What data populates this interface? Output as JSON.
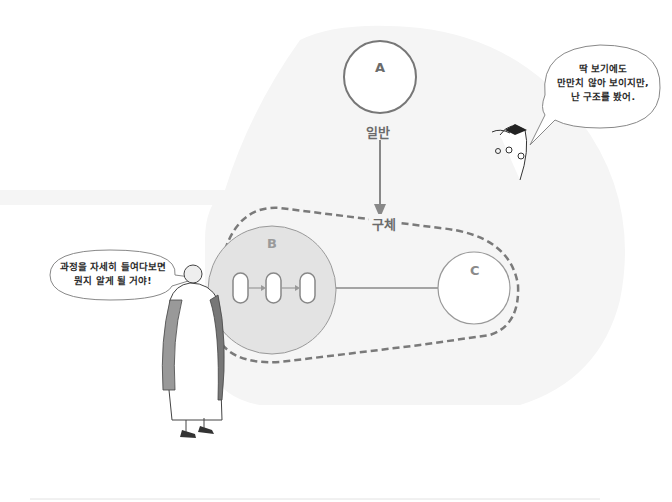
{
  "diagram": {
    "nodes": {
      "a": {
        "label": "A",
        "caption": "일반"
      },
      "b": {
        "label": "B",
        "process_steps": 3
      },
      "c": {
        "label": "C"
      }
    },
    "group_label": "구체",
    "edges": [
      {
        "from": "A",
        "to": "구체",
        "type": "arrow"
      },
      {
        "from": "B",
        "to": "C",
        "type": "line"
      }
    ]
  },
  "speech_bubbles": {
    "right": {
      "lines": [
        "딱 보기에도",
        "만만치 않아 보이지만,",
        "난 구조를 봤어."
      ]
    },
    "left": {
      "lines": [
        "과정을 자세히 들여다보면",
        "뭔지 알게 될 거야!"
      ]
    }
  },
  "colors": {
    "background_shape": "#f4f4f4",
    "circle_b_fill": "#e2e2e2",
    "stroke": "#7a7a7a",
    "text": "#6b6b6b"
  }
}
